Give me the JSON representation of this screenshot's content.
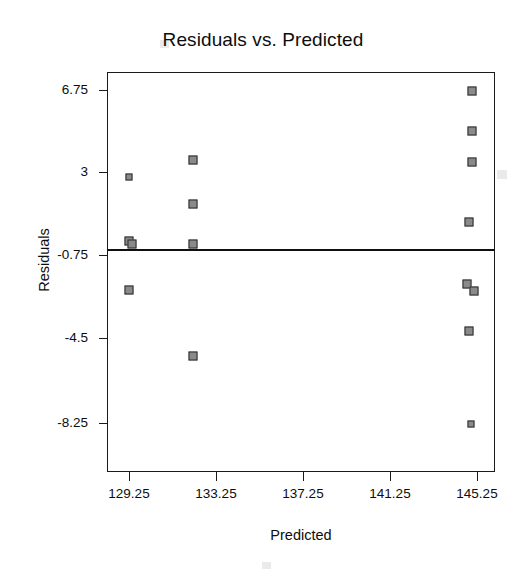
{
  "chart_data": {
    "type": "scatter",
    "title": "Residuals vs. Predicted",
    "xlabel": "Predicted",
    "ylabel": "Residuals",
    "grid": false,
    "legend": null,
    "xlim": [
      127.2,
      146.4
    ],
    "ylim": [
      -9.6,
      8.1
    ],
    "xticks": [
      129.25,
      133.25,
      137.25,
      141.25,
      145.25
    ],
    "xtick_labels": [
      "129.25",
      "133.25",
      "137.25",
      "141.25",
      "145.25"
    ],
    "yticks": [
      6.75,
      3,
      -0.75,
      -4.5,
      -8.25
    ],
    "ytick_labels": [
      "6.75",
      "3",
      "-0.75",
      "-4.5",
      "-8.25"
    ],
    "reference_line": {
      "y": 0,
      "orientation": "horizontal"
    },
    "points": [
      {
        "x": 129.25,
        "y": 2.85
      },
      {
        "x": 129.25,
        "y": -0.05
      },
      {
        "x": 129.4,
        "y": -0.2
      },
      {
        "x": 129.25,
        "y": -2.25
      },
      {
        "x": 132.2,
        "y": 3.6
      },
      {
        "x": 132.2,
        "y": 1.6
      },
      {
        "x": 132.2,
        "y": -0.2
      },
      {
        "x": 132.2,
        "y": -5.25
      },
      {
        "x": 145.0,
        "y": 6.7
      },
      {
        "x": 145.0,
        "y": 4.9
      },
      {
        "x": 145.0,
        "y": 3.5
      },
      {
        "x": 144.9,
        "y": 0.8
      },
      {
        "x": 144.8,
        "y": -2.0
      },
      {
        "x": 145.1,
        "y": -2.3
      },
      {
        "x": 144.9,
        "y": -4.1
      },
      {
        "x": 144.95,
        "y": -8.3
      }
    ],
    "n_points": 16
  },
  "colors": {
    "marker_fill": "#8a8a8a",
    "marker_edge": "#2b2b2b",
    "axis": "#1a1a1a",
    "text": "#0d0d0d",
    "background": "#ffffff"
  }
}
